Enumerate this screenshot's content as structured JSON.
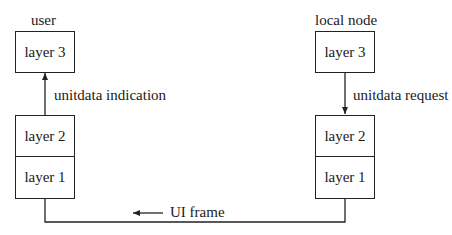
{
  "diagram": {
    "type": "protocol-layer-diagram",
    "left_node": {
      "title": "user",
      "layers": {
        "top": "layer 3",
        "middle": "layer 2",
        "bottom": "layer 1"
      },
      "primitive": {
        "label": "unitdata indication",
        "direction": "up"
      }
    },
    "right_node": {
      "title": "local node",
      "layers": {
        "top": "layer 3",
        "middle": "layer 2",
        "bottom": "layer 1"
      },
      "primitive": {
        "label": "unitdata request",
        "direction": "down"
      }
    },
    "link": {
      "label": "UI frame",
      "direction": "left"
    },
    "colors": {
      "line": "#222222",
      "text": "#1a1a1a",
      "background": "#ffffff"
    }
  }
}
